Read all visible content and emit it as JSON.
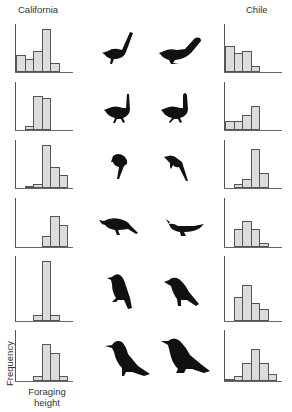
{
  "headers": {
    "left": "California",
    "right": "Chile"
  },
  "axis_labels": {
    "y": "Frequency",
    "x_line1": "Foraging",
    "x_line2": "height"
  },
  "colors": {
    "bar_fill": "#dcdcdc",
    "bar_stroke": "#555555",
    "bird": "#111111"
  },
  "chart_data": {
    "type": "bar",
    "xlabel": "Foraging height",
    "ylabel": "Frequency",
    "grid": false,
    "panels": [
      {
        "row": 1,
        "region": "California",
        "values": [
          4,
          3,
          5,
          10,
          2
        ]
      },
      {
        "row": 1,
        "region": "Chile",
        "values": [
          6,
          4.5,
          5,
          1.5
        ]
      },
      {
        "row": 2,
        "region": "California",
        "values": [
          0,
          1,
          8,
          7.5
        ]
      },
      {
        "row": 2,
        "region": "Chile",
        "values": [
          2,
          2,
          3.5,
          5.5
        ]
      },
      {
        "row": 3,
        "region": "California",
        "values": [
          0,
          0.5,
          1,
          10,
          5,
          3
        ]
      },
      {
        "row": 3,
        "region": "Chile",
        "values": [
          0,
          1,
          2,
          9,
          3.5
        ]
      },
      {
        "row": 4,
        "region": "California",
        "values": [
          0,
          0,
          0,
          2.5,
          7,
          5
        ]
      },
      {
        "row": 4,
        "region": "Chile",
        "values": [
          0,
          4,
          6,
          4,
          1
        ]
      },
      {
        "row": 5,
        "region": "California",
        "values": [
          0,
          0,
          1,
          10,
          1
        ]
      },
      {
        "row": 5,
        "region": "Chile",
        "values": [
          0,
          4,
          6,
          3,
          2
        ]
      },
      {
        "row": 6,
        "region": "California",
        "values": [
          0,
          0,
          1,
          8,
          6,
          1
        ]
      },
      {
        "row": 6,
        "region": "Chile",
        "values": [
          0.5,
          1,
          4,
          7,
          4,
          1.5
        ]
      }
    ]
  }
}
